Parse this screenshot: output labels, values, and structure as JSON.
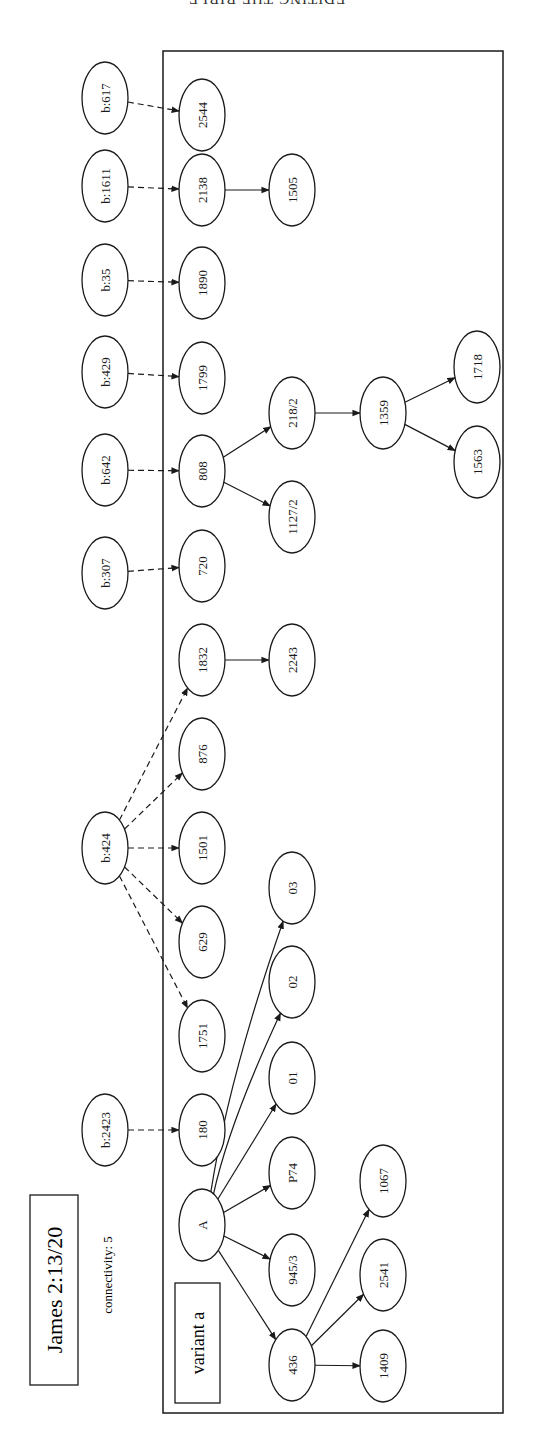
{
  "page": {
    "running_head": "EDITING THE BIBLE"
  },
  "diagram": {
    "title": "James 2:13/20",
    "connectivity_label": "connectivity: 5",
    "variant_label": "variant a",
    "orientation": "rotated 90° counter-clockwise (text reads bottom-to-top)",
    "nodes": [
      {
        "id": "b617",
        "label": "b:617",
        "x": 105,
        "y": 98,
        "group": "external"
      },
      {
        "id": "b1611",
        "label": "b:1611",
        "x": 105,
        "y": 186,
        "group": "external"
      },
      {
        "id": "b35",
        "label": "b:35",
        "x": 105,
        "y": 280,
        "group": "external"
      },
      {
        "id": "b429",
        "label": "b:429",
        "x": 105,
        "y": 372,
        "group": "external"
      },
      {
        "id": "b642",
        "label": "b:642",
        "x": 105,
        "y": 470,
        "group": "external"
      },
      {
        "id": "b307",
        "label": "b:307",
        "x": 105,
        "y": 573,
        "group": "external"
      },
      {
        "id": "b424",
        "label": "b:424",
        "x": 105,
        "y": 848,
        "group": "external"
      },
      {
        "id": "b2423",
        "label": "b:2423",
        "x": 105,
        "y": 1130,
        "group": "external"
      },
      {
        "id": "n2544",
        "label": "2544",
        "x": 202,
        "y": 115,
        "group": "variant"
      },
      {
        "id": "n2138",
        "label": "2138",
        "x": 202,
        "y": 190,
        "group": "variant"
      },
      {
        "id": "n1890",
        "label": "1890",
        "x": 202,
        "y": 283,
        "group": "variant"
      },
      {
        "id": "n1799",
        "label": "1799",
        "x": 202,
        "y": 378,
        "group": "variant"
      },
      {
        "id": "n808",
        "label": "808",
        "x": 202,
        "y": 471,
        "group": "variant"
      },
      {
        "id": "n720",
        "label": "720",
        "x": 202,
        "y": 566,
        "group": "variant"
      },
      {
        "id": "n1832",
        "label": "1832",
        "x": 202,
        "y": 660,
        "group": "variant"
      },
      {
        "id": "n876",
        "label": "876",
        "x": 202,
        "y": 754,
        "group": "variant"
      },
      {
        "id": "n1501",
        "label": "1501",
        "x": 202,
        "y": 848,
        "group": "variant"
      },
      {
        "id": "n629",
        "label": "629",
        "x": 202,
        "y": 942,
        "group": "variant"
      },
      {
        "id": "n1751",
        "label": "1751",
        "x": 202,
        "y": 1036,
        "group": "variant"
      },
      {
        "id": "n180",
        "label": "180",
        "x": 202,
        "y": 1130,
        "group": "variant"
      },
      {
        "id": "nA",
        "label": "A",
        "x": 202,
        "y": 1225,
        "group": "variant"
      },
      {
        "id": "n1505",
        "label": "1505",
        "x": 292,
        "y": 190,
        "group": "variant"
      },
      {
        "id": "n218",
        "label": "218/2",
        "x": 292,
        "y": 413,
        "group": "variant"
      },
      {
        "id": "n1127",
        "label": "1127/2",
        "x": 292,
        "y": 517,
        "group": "variant"
      },
      {
        "id": "n2243",
        "label": "2243",
        "x": 292,
        "y": 660,
        "group": "variant"
      },
      {
        "id": "n03",
        "label": "03",
        "x": 292,
        "y": 888,
        "group": "variant"
      },
      {
        "id": "n02",
        "label": "02",
        "x": 292,
        "y": 982,
        "group": "variant"
      },
      {
        "id": "n01",
        "label": "01",
        "x": 292,
        "y": 1078,
        "group": "variant"
      },
      {
        "id": "nP74",
        "label": "P74",
        "x": 292,
        "y": 1173,
        "group": "variant"
      },
      {
        "id": "n945",
        "label": "945/3",
        "x": 292,
        "y": 1270,
        "group": "variant"
      },
      {
        "id": "n436",
        "label": "436",
        "x": 292,
        "y": 1365,
        "group": "variant"
      },
      {
        "id": "n1359",
        "label": "1359",
        "x": 383,
        "y": 413,
        "group": "variant"
      },
      {
        "id": "n1067",
        "label": "1067",
        "x": 383,
        "y": 1181,
        "group": "variant"
      },
      {
        "id": "n2541",
        "label": "2541",
        "x": 383,
        "y": 1275,
        "group": "variant"
      },
      {
        "id": "n1409",
        "label": "1409",
        "x": 383,
        "y": 1366,
        "group": "variant"
      },
      {
        "id": "n1718",
        "label": "1718",
        "x": 477,
        "y": 367,
        "group": "variant"
      },
      {
        "id": "n1563",
        "label": "1563",
        "x": 477,
        "y": 462,
        "group": "variant"
      }
    ],
    "edges": [
      {
        "from": "b617",
        "to": "n2544",
        "style": "dashed"
      },
      {
        "from": "b1611",
        "to": "n2138",
        "style": "dashed"
      },
      {
        "from": "b35",
        "to": "n1890",
        "style": "dashed"
      },
      {
        "from": "b429",
        "to": "n1799",
        "style": "dashed"
      },
      {
        "from": "b642",
        "to": "n808",
        "style": "dashed"
      },
      {
        "from": "b307",
        "to": "n720",
        "style": "dashed"
      },
      {
        "from": "b424",
        "to": "n1832",
        "style": "dashed"
      },
      {
        "from": "b424",
        "to": "n876",
        "style": "dashed"
      },
      {
        "from": "b424",
        "to": "n1501",
        "style": "dashed"
      },
      {
        "from": "b424",
        "to": "n629",
        "style": "dashed"
      },
      {
        "from": "b424",
        "to": "n1751",
        "style": "dashed"
      },
      {
        "from": "b2423",
        "to": "n180",
        "style": "dashed"
      },
      {
        "from": "n2138",
        "to": "n1505",
        "style": "solid"
      },
      {
        "from": "n808",
        "to": "n218",
        "style": "solid"
      },
      {
        "from": "n808",
        "to": "n1127",
        "style": "solid"
      },
      {
        "from": "n218",
        "to": "n1359",
        "style": "solid"
      },
      {
        "from": "n1359",
        "to": "n1718",
        "style": "solid"
      },
      {
        "from": "n1359",
        "to": "n1563",
        "style": "solid"
      },
      {
        "from": "n1832",
        "to": "n2243",
        "style": "solid"
      },
      {
        "from": "nA",
        "to": "n03",
        "style": "solid"
      },
      {
        "from": "nA",
        "to": "n02",
        "style": "solid"
      },
      {
        "from": "nA",
        "to": "n01",
        "style": "solid"
      },
      {
        "from": "nA",
        "to": "nP74",
        "style": "solid"
      },
      {
        "from": "nA",
        "to": "n945",
        "style": "solid"
      },
      {
        "from": "nA",
        "to": "n436",
        "style": "solid"
      },
      {
        "from": "n436",
        "to": "n1067",
        "style": "solid"
      },
      {
        "from": "n436",
        "to": "n2541",
        "style": "solid"
      },
      {
        "from": "n436",
        "to": "n1409",
        "style": "solid"
      }
    ],
    "colors": {
      "ink": "#1a1a1a",
      "background": "#ffffff"
    }
  }
}
